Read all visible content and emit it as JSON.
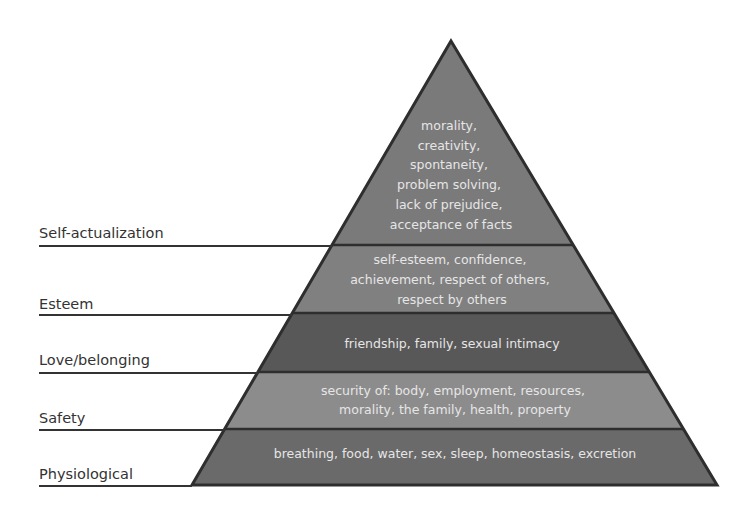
{
  "diagram": {
    "type": "pyramid",
    "colors": {
      "outline": "#2e2e2e",
      "text": "#e6e6e6",
      "label_text": "#333333",
      "label_line": "#333333"
    },
    "levels": [
      {
        "name": "Self-actualization",
        "fill": "#7a7a7a",
        "lines": [
          "morality,",
          "creativity,",
          "spontaneity,",
          "problem solving,",
          "lack of prejudice,",
          "acceptance of facts"
        ]
      },
      {
        "name": "Esteem",
        "fill": "#808080",
        "lines": [
          "self-esteem, confidence,",
          "achievement, respect of others,",
          "respect by others"
        ]
      },
      {
        "name": "Love/belonging",
        "fill": "#585858",
        "lines": [
          "friendship, family, sexual intimacy"
        ]
      },
      {
        "name": "Safety",
        "fill": "#8c8c8c",
        "lines": [
          "security of: body, employment, resources,",
          "morality, the family, health, property"
        ]
      },
      {
        "name": "Physiological",
        "fill": "#6a6a6a",
        "lines": [
          "breathing, food, water, sex, sleep, homeostasis, excretion"
        ]
      }
    ]
  }
}
